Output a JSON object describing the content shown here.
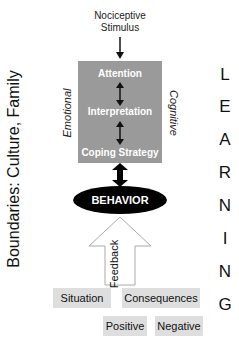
{
  "stimulus": {
    "line1": "Nociceptive",
    "line2": "Stimulus"
  },
  "core": {
    "steps": [
      "Attention",
      "Interpretation",
      "Coping Strategy"
    ],
    "left_label": "Emotional",
    "right_label": "Cognitive",
    "box_color": "#9a9a9a"
  },
  "behavior": {
    "label": "BEHAVIOR"
  },
  "feedback": {
    "label": "Feedback"
  },
  "boundaries": {
    "label": "Boundaries: Culture, Family"
  },
  "learning": {
    "letters": [
      "L",
      "E",
      "A",
      "R",
      "N",
      "I",
      "N",
      "G"
    ]
  },
  "outcomes": {
    "situation": "Situation",
    "consequences": "Consequences",
    "positive": "Positive",
    "negative": "Negative"
  }
}
